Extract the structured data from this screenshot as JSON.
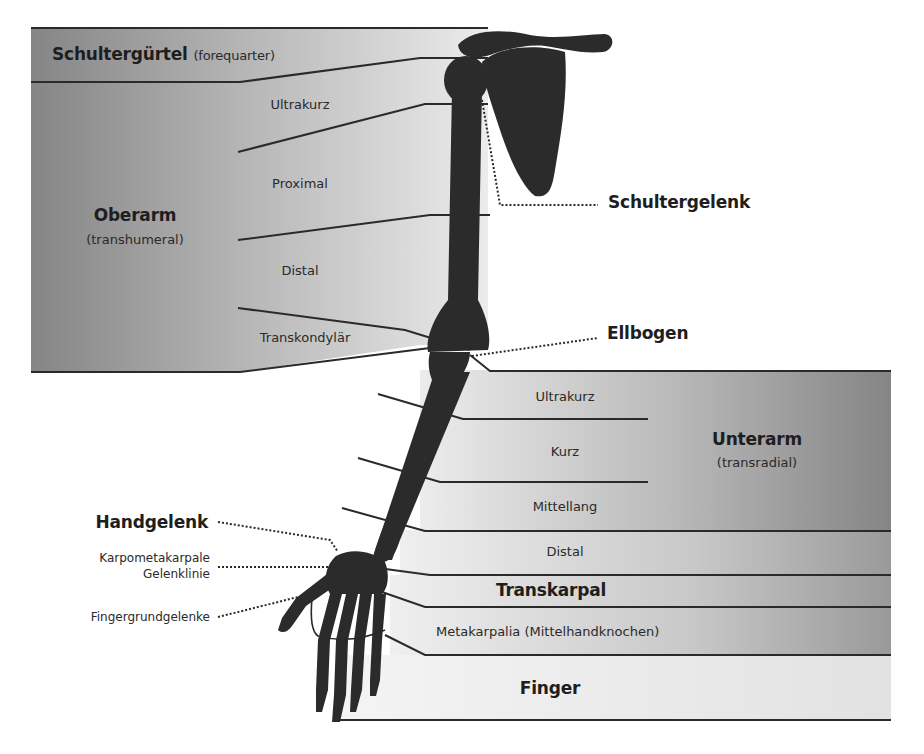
{
  "diagram": {
    "type": "anatomical amputation levels - upper limb",
    "colors": {
      "band_dark": "#8a8a8a",
      "band_light": "#ececec",
      "bone": "#2b2b2b",
      "line": "#2a2a2a"
    },
    "shoulder": {
      "title": "Schultergürtel",
      "subtitle": "(forequarter)"
    },
    "upper_arm": {
      "title": "Oberarm",
      "subtitle": "(transhumeral)",
      "levels": [
        "Ultrakurz",
        "Proximal",
        "Distal",
        "Transkondylär"
      ]
    },
    "forearm": {
      "title": "Unterarm",
      "subtitle": "(transradial)",
      "levels": [
        "Ultrakurz",
        "Kurz",
        "Mittellang",
        "Distal"
      ]
    },
    "hand": {
      "transcarpal": "Transkarpal",
      "metacarpal": "Metakarpalia (Mittelhandknochen)",
      "finger": "Finger"
    },
    "joints": {
      "shoulder_joint": "Schultergelenk",
      "elbow": "Ellbogen",
      "wrist": "Handgelenk",
      "cmc_line_1": "Karpometakarpale",
      "cmc_line_2": "Gelenklinie",
      "mcp": "Fingergrundgelenke"
    }
  }
}
